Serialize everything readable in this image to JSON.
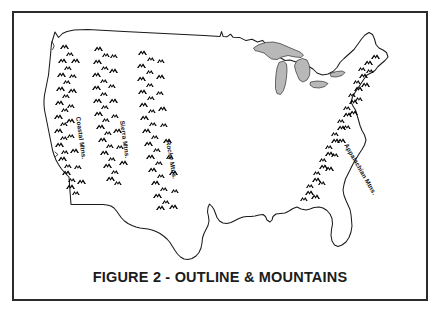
{
  "figure": {
    "caption": "FIGURE 2 - OUTLINE & MOUNTAINS",
    "border_color": "#2b2b2b",
    "background_color": "#ffffff",
    "outline_color": "#1a1a1a",
    "lake_fill_color": "#b8b8b8",
    "mountain_color": "#000000"
  },
  "map": {
    "subject": "united-states-outline",
    "lakes": {
      "name": "great-lakes",
      "fill": "#b8b8b8"
    },
    "ranges": [
      {
        "id": "coastal",
        "label": "Coastal Mtns.",
        "label_x": 62,
        "label_y": 104,
        "label_rotation": 82
      },
      {
        "id": "sierra",
        "label": "Sierra Mtns.",
        "label_x": 106,
        "label_y": 108,
        "label_rotation": 82
      },
      {
        "id": "rocky",
        "label": "Rocky Mtns.",
        "label_x": 152,
        "label_y": 128,
        "label_rotation": 80
      },
      {
        "id": "appalachian",
        "label": "Appalachian Mtns.",
        "label_x": 330,
        "label_y": 132,
        "label_rotation": 60
      }
    ]
  }
}
